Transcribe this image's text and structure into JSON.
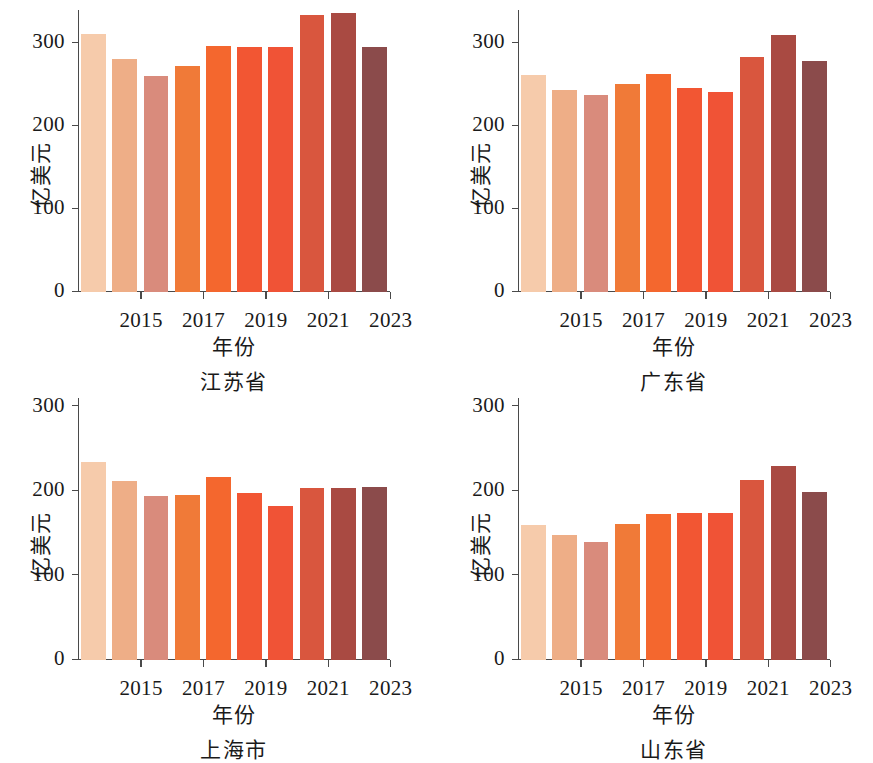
{
  "figure": {
    "background": "#ffffff",
    "axis_color": "#4a4a4a",
    "text_color": "#1a1a1a"
  },
  "axis": {
    "ylabel": "亿美元",
    "xlabel": "年份",
    "y_ticks": [
      0,
      100,
      200,
      300
    ],
    "y_tick_labels": [
      "0",
      "100",
      "200",
      "300"
    ],
    "x_tick_labels": [
      "2015",
      "2017",
      "2019",
      "2021",
      "2023"
    ],
    "ylim": [
      0,
      340
    ],
    "ylim_bottom_row": [
      0,
      310
    ]
  },
  "palette": [
    "#f6cbab",
    "#eeae87",
    "#d98b7c",
    "#f07a38",
    "#f4672e",
    "#f25633",
    "#f05336",
    "#d9563e",
    "#a94a42",
    "#8b4b4b"
  ],
  "panels": [
    {
      "title": "江苏省",
      "position": "top-left"
    },
    {
      "title": "广东省",
      "position": "top-right"
    },
    {
      "title": "上海市",
      "position": "bottom-left"
    },
    {
      "title": "山东省",
      "position": "bottom-right"
    }
  ],
  "chart_data": {
    "type": "bar",
    "title": "",
    "subtitle": "",
    "xlabel": "年份",
    "ylabel": "亿美元",
    "grid": false,
    "legend": "none",
    "x": [
      2014,
      2015,
      2016,
      2017,
      2018,
      2019,
      2020,
      2021,
      2022,
      2023
    ],
    "categories": [
      "2014",
      "2015",
      "2016",
      "2017",
      "2018",
      "2019",
      "2020",
      "2021",
      "2022",
      "2023"
    ],
    "x_tick_labels": [
      "2015",
      "2017",
      "2019",
      "2021",
      "2023"
    ],
    "y_tick_labels": [
      "0",
      "100",
      "200",
      "300"
    ],
    "ylim": [
      0,
      340
    ],
    "units": "亿美元",
    "panels": [
      {
        "title": "江苏省",
        "ylim": [
          0,
          340
        ],
        "series": [
          {
            "name": "江苏省",
            "values": [
              311,
              281,
              260,
              273,
              297,
              296,
              295,
              334,
              337,
              296
            ]
          }
        ]
      },
      {
        "title": "广东省",
        "ylim": [
          0,
          340
        ],
        "series": [
          {
            "name": "广东省",
            "values": [
              262,
              244,
              238,
              251,
              263,
              246,
              241,
              283,
              310,
              279
            ]
          }
        ]
      },
      {
        "title": "上海市",
        "ylim": [
          0,
          310
        ],
        "series": [
          {
            "name": "上海市",
            "values": [
              234,
              212,
              194,
              195,
              217,
              198,
              182,
              204,
              203,
              205
            ]
          }
        ]
      },
      {
        "title": "山东省",
        "ylim": [
          0,
          310
        ],
        "series": [
          {
            "name": "山东省",
            "values": [
              160,
              148,
              140,
              161,
              173,
              174,
              174,
              213,
              229,
              199
            ]
          }
        ]
      }
    ]
  }
}
